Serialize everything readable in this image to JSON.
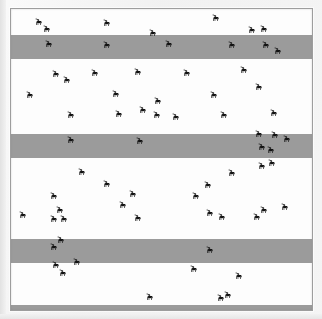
{
  "figure": {
    "caption": "",
    "background_color": "#f3f3f3",
    "plot_background_color": "#ffffff",
    "frame_border_color": "#9d9d9d",
    "band_color": "#9b9b9b",
    "marker_color": "#121212",
    "marker_icon": "moose-silhouette-icon"
  },
  "chart_data": {
    "type": "scatter",
    "title": "",
    "subtitle": "",
    "xlabel": "",
    "ylabel": "",
    "xlim": [
      0,
      301
    ],
    "ylim": [
      0,
      301
    ],
    "grid": false,
    "legend": null,
    "marker_symbol": "moose",
    "marker_count": 69,
    "bands": [
      {
        "name": "transect-strip-1",
        "y": 26,
        "height": 24,
        "color": "#9b9b9b"
      },
      {
        "name": "transect-strip-2",
        "y": 125,
        "height": 24,
        "color": "#9b9b9b"
      },
      {
        "name": "transect-strip-3",
        "y": 230,
        "height": 24,
        "color": "#9b9b9b"
      },
      {
        "name": "transect-strip-4",
        "y": 296,
        "height": 6,
        "color": "#9b9b9b"
      }
    ],
    "points": [
      {
        "x": 23,
        "y": 8,
        "flip": false
      },
      {
        "x": 31,
        "y": 15,
        "flip": false
      },
      {
        "x": 91,
        "y": 9,
        "flip": false
      },
      {
        "x": 137,
        "y": 19,
        "flip": false
      },
      {
        "x": 200,
        "y": 4,
        "flip": false
      },
      {
        "x": 236,
        "y": 16,
        "flip": false
      },
      {
        "x": 248,
        "y": 15,
        "flip": false
      },
      {
        "x": 33,
        "y": 30,
        "flip": false
      },
      {
        "x": 91,
        "y": 31,
        "flip": false
      },
      {
        "x": 153,
        "y": 30,
        "flip": false
      },
      {
        "x": 216,
        "y": 31,
        "flip": false
      },
      {
        "x": 250,
        "y": 31,
        "flip": false
      },
      {
        "x": 262,
        "y": 37,
        "flip": false
      },
      {
        "x": 40,
        "y": 60,
        "flip": false
      },
      {
        "x": 51,
        "y": 66,
        "flip": false
      },
      {
        "x": 79,
        "y": 59,
        "flip": false
      },
      {
        "x": 122,
        "y": 58,
        "flip": false
      },
      {
        "x": 228,
        "y": 56,
        "flip": false
      },
      {
        "x": 14,
        "y": 81,
        "flip": false
      },
      {
        "x": 100,
        "y": 80,
        "flip": false
      },
      {
        "x": 142,
        "y": 87,
        "flip": false
      },
      {
        "x": 243,
        "y": 73,
        "flip": false
      },
      {
        "x": 198,
        "y": 81,
        "flip": false
      },
      {
        "x": 55,
        "y": 101,
        "flip": false
      },
      {
        "x": 103,
        "y": 100,
        "flip": false
      },
      {
        "x": 127,
        "y": 96,
        "flip": false
      },
      {
        "x": 141,
        "y": 101,
        "flip": false
      },
      {
        "x": 208,
        "y": 101,
        "flip": false
      },
      {
        "x": 258,
        "y": 99,
        "flip": false
      },
      {
        "x": 55,
        "y": 126,
        "flip": false
      },
      {
        "x": 124,
        "y": 127,
        "flip": false
      },
      {
        "x": 243,
        "y": 120,
        "flip": false
      },
      {
        "x": 259,
        "y": 121,
        "flip": false
      },
      {
        "x": 246,
        "y": 133,
        "flip": false
      },
      {
        "x": 255,
        "y": 136,
        "flip": false
      },
      {
        "x": 66,
        "y": 158,
        "flip": false
      },
      {
        "x": 91,
        "y": 170,
        "flip": false
      },
      {
        "x": 216,
        "y": 159,
        "flip": false
      },
      {
        "x": 246,
        "y": 152,
        "flip": false
      },
      {
        "x": 256,
        "y": 149,
        "flip": false
      },
      {
        "x": 38,
        "y": 182,
        "flip": false
      },
      {
        "x": 192,
        "y": 171,
        "flip": false
      },
      {
        "x": 180,
        "y": 182,
        "flip": false
      },
      {
        "x": 117,
        "y": 180,
        "flip": false
      },
      {
        "x": 44,
        "y": 196,
        "flip": false
      },
      {
        "x": 7,
        "y": 201,
        "flip": false
      },
      {
        "x": 38,
        "y": 205,
        "flip": false
      },
      {
        "x": 48,
        "y": 205,
        "flip": false
      },
      {
        "x": 122,
        "y": 204,
        "flip": false
      },
      {
        "x": 194,
        "y": 199,
        "flip": false
      },
      {
        "x": 206,
        "y": 203,
        "flip": false
      },
      {
        "x": 248,
        "y": 196,
        "flip": false
      },
      {
        "x": 107,
        "y": 191,
        "flip": false
      },
      {
        "x": 241,
        "y": 203,
        "flip": false
      },
      {
        "x": 45,
        "y": 226,
        "flip": false
      },
      {
        "x": 38,
        "y": 233,
        "flip": false
      },
      {
        "x": 194,
        "y": 236,
        "flip": false
      },
      {
        "x": 40,
        "y": 251,
        "flip": false
      },
      {
        "x": 61,
        "y": 248,
        "flip": false
      },
      {
        "x": 47,
        "y": 259,
        "flip": false
      },
      {
        "x": 178,
        "y": 255,
        "flip": false
      },
      {
        "x": 223,
        "y": 262,
        "flip": false
      },
      {
        "x": 134,
        "y": 283,
        "flip": false
      },
      {
        "x": 212,
        "y": 281,
        "flip": false
      },
      {
        "x": 269,
        "y": 193,
        "flip": false
      },
      {
        "x": 271,
        "y": 125,
        "flip": false
      },
      {
        "x": 171,
        "y": 59,
        "flip": false
      },
      {
        "x": 160,
        "y": 103,
        "flip": false
      },
      {
        "x": 205,
        "y": 284,
        "flip": false
      }
    ]
  }
}
